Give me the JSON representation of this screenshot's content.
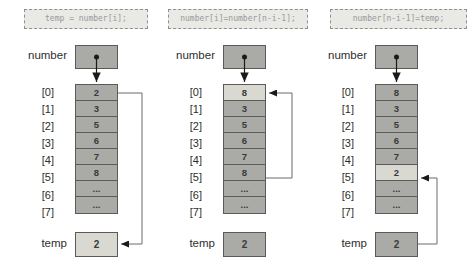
{
  "panels": [
    {
      "code": "temp = number[i];",
      "array_label": "number",
      "indices": [
        "[0]",
        "[1]",
        "[2]",
        "[3]",
        "[4]",
        "[5]",
        "[6]",
        "[7]"
      ],
      "values": [
        "2",
        "3",
        "5",
        "6",
        "7",
        "8",
        "...",
        "..."
      ],
      "highlight_index": null,
      "temp_label": "temp",
      "temp_value": "2",
      "temp_highlight": true
    },
    {
      "code": "number[i]=number[n-i-1];",
      "array_label": "number",
      "indices": [
        "[0]",
        "[1]",
        "[2]",
        "[3]",
        "[4]",
        "[5]",
        "[6]",
        "[7]"
      ],
      "values": [
        "8",
        "3",
        "5",
        "6",
        "7",
        "8",
        "...",
        "..."
      ],
      "highlight_index": 0,
      "temp_label": "temp",
      "temp_value": "2",
      "temp_highlight": false
    },
    {
      "code": "number[n-i-1]=temp;",
      "array_label": "number",
      "indices": [
        "[0]",
        "[1]",
        "[2]",
        "[3]",
        "[4]",
        "[5]",
        "[6]",
        "[7]"
      ],
      "values": [
        "8",
        "3",
        "5",
        "6",
        "7",
        "2",
        "...",
        "..."
      ],
      "highlight_index": 5,
      "temp_label": "temp",
      "temp_value": "2",
      "temp_highlight": false
    }
  ],
  "colors": {
    "cell_fill": "#aaaaa6",
    "cell_highlight": "#d9d9d1",
    "box_border": "#5a5a5a",
    "code_bg": "#e9e9e6",
    "code_text": "#999999",
    "label_text": "#2e2e2e",
    "connector": "#6a6a6a",
    "arrow": "#1a1a1a"
  }
}
